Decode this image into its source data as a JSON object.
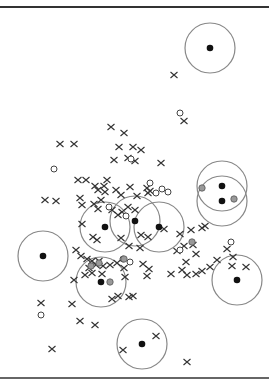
{
  "chart_data": {
    "type": "scatter",
    "title": "",
    "xlabel": "",
    "ylabel": "",
    "grid": false,
    "legend": null,
    "colors": {
      "cross": "#333333",
      "open_circle": "#444444",
      "grey_point": "#999999",
      "center": "#111111",
      "radius_circle": "#888888"
    },
    "centers": [
      {
        "x": 210,
        "y": 48,
        "r": 25
      },
      {
        "x": 222,
        "y": 186,
        "r": 25
      },
      {
        "x": 222,
        "y": 201,
        "r": 25
      },
      {
        "x": 105,
        "y": 227,
        "r": 25
      },
      {
        "x": 135,
        "y": 221,
        "r": 25
      },
      {
        "x": 159,
        "y": 227,
        "r": 25
      },
      {
        "x": 43,
        "y": 256,
        "r": 25
      },
      {
        "x": 101,
        "y": 282,
        "r": 25
      },
      {
        "x": 237,
        "y": 280,
        "r": 25
      },
      {
        "x": 142,
        "y": 344,
        "r": 25
      }
    ],
    "crosses": [
      [
        174,
        75
      ],
      [
        111,
        127
      ],
      [
        124,
        133
      ],
      [
        184,
        121
      ],
      [
        60,
        144
      ],
      [
        74,
        144
      ],
      [
        119,
        147
      ],
      [
        133,
        147
      ],
      [
        114,
        160
      ],
      [
        128,
        158
      ],
      [
        141,
        150
      ],
      [
        135,
        161
      ],
      [
        161,
        163
      ],
      [
        78,
        180
      ],
      [
        86,
        180
      ],
      [
        95,
        186
      ],
      [
        98,
        190
      ],
      [
        107,
        180
      ],
      [
        104,
        186
      ],
      [
        80,
        198
      ],
      [
        105,
        192
      ],
      [
        101,
        200
      ],
      [
        94,
        204
      ],
      [
        82,
        205
      ],
      [
        98,
        209
      ],
      [
        45,
        200
      ],
      [
        56,
        201
      ],
      [
        116,
        190
      ],
      [
        121,
        195
      ],
      [
        130,
        187
      ],
      [
        147,
        188
      ],
      [
        148,
        193
      ],
      [
        150,
        191
      ],
      [
        137,
        196
      ],
      [
        128,
        207
      ],
      [
        135,
        210
      ],
      [
        122,
        212
      ],
      [
        112,
        210
      ],
      [
        82,
        224
      ],
      [
        93,
        237
      ],
      [
        97,
        240
      ],
      [
        118,
        215
      ],
      [
        121,
        238
      ],
      [
        129,
        246
      ],
      [
        141,
        235
      ],
      [
        148,
        237
      ],
      [
        164,
        229
      ],
      [
        140,
        248
      ],
      [
        180,
        234
      ],
      [
        184,
        246
      ],
      [
        191,
        230
      ],
      [
        193,
        245
      ],
      [
        202,
        228
      ],
      [
        205,
        226
      ],
      [
        217,
        260
      ],
      [
        227,
        249
      ],
      [
        232,
        266
      ],
      [
        233,
        257
      ],
      [
        210,
        267
      ],
      [
        196,
        254
      ],
      [
        177,
        251
      ],
      [
        186,
        262
      ],
      [
        182,
        270
      ],
      [
        149,
        269
      ],
      [
        143,
        264
      ],
      [
        124,
        268
      ],
      [
        117,
        263
      ],
      [
        110,
        265
      ],
      [
        103,
        266
      ],
      [
        96,
        265
      ],
      [
        89,
        268
      ],
      [
        76,
        250
      ],
      [
        81,
        256
      ],
      [
        87,
        259
      ],
      [
        92,
        261
      ],
      [
        99,
        261
      ],
      [
        125,
        277
      ],
      [
        147,
        276
      ],
      [
        171,
        274
      ],
      [
        187,
        275
      ],
      [
        196,
        274
      ],
      [
        202,
        271
      ],
      [
        74,
        280
      ],
      [
        85,
        275
      ],
      [
        92,
        273
      ],
      [
        102,
        274
      ],
      [
        118,
        296
      ],
      [
        129,
        297
      ],
      [
        133,
        296
      ],
      [
        112,
        299
      ],
      [
        41,
        303
      ],
      [
        72,
        304
      ],
      [
        80,
        321
      ],
      [
        95,
        325
      ],
      [
        52,
        349
      ],
      [
        156,
        336
      ],
      [
        123,
        350
      ],
      [
        187,
        362
      ],
      [
        246,
        267
      ]
    ],
    "open_circles": [
      [
        180,
        113
      ],
      [
        54,
        169
      ],
      [
        131,
        159
      ],
      [
        150,
        183
      ],
      [
        162,
        189
      ],
      [
        109,
        207
      ],
      [
        126,
        216
      ],
      [
        130,
        262
      ],
      [
        180,
        250
      ],
      [
        231,
        242
      ],
      [
        123,
        259
      ],
      [
        156,
        193
      ],
      [
        168,
        192
      ],
      [
        41,
        315
      ]
    ],
    "grey_points": [
      [
        202,
        188
      ],
      [
        234,
        199
      ],
      [
        192,
        242
      ],
      [
        124,
        259
      ],
      [
        99,
        263
      ],
      [
        91,
        266
      ],
      [
        110,
        282
      ]
    ]
  }
}
